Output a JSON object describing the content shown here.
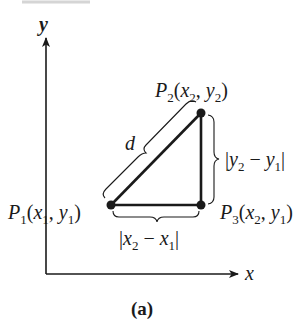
{
  "figure": {
    "caption": "(a)",
    "axes": {
      "x_label": "x",
      "y_label": "y"
    },
    "points": [
      {
        "id": "P1",
        "name": "P",
        "sub": "1",
        "coords": [
          "x",
          "1",
          "y",
          "1"
        ],
        "label": "P1(x1, y1)"
      },
      {
        "id": "P2",
        "name": "P",
        "sub": "2",
        "coords": [
          "x",
          "2",
          "y",
          "2"
        ],
        "label": "P2(x2, y2)"
      },
      {
        "id": "P3",
        "name": "P",
        "sub": "3",
        "coords": [
          "x",
          "2",
          "y",
          "1"
        ],
        "label": "P3(x2, y1)"
      }
    ],
    "distance_label": "d",
    "horizontal_leg_label": "|x2 − x1|",
    "vertical_leg_label": "|y2 − y1|",
    "colors": {
      "ink": "#1a1a1a",
      "background": "#ffffff"
    }
  }
}
